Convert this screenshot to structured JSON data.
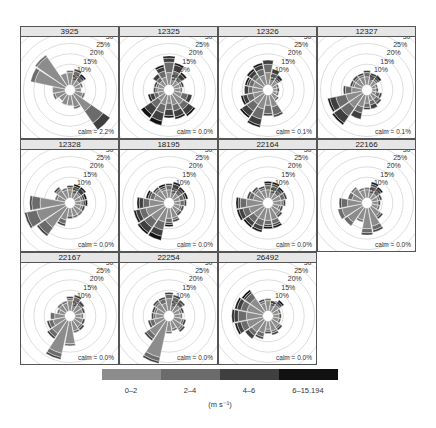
{
  "chart_data": {
    "type": "windrose",
    "title": "",
    "layout": {
      "rows": 3,
      "cols": 4
    },
    "axis": {
      "rings_percent": [
        5,
        10,
        15,
        20,
        25,
        30
      ],
      "ring_labels": [
        "5%",
        "10%",
        "15%",
        "20%",
        "25%",
        "30"
      ]
    },
    "directions": [
      "N",
      "NNE",
      "NE",
      "ENE",
      "E",
      "ESE",
      "SE",
      "SSE",
      "S",
      "SSW",
      "SW",
      "WSW",
      "W",
      "WNW",
      "NW",
      "NNW"
    ],
    "speed_bins": [
      "0-2",
      "2-4",
      "4-6",
      "6-15.194"
    ],
    "speed_colors": [
      "#8c8c8c",
      "#6b6b6b",
      "#3f3f3f",
      "#111111"
    ],
    "legend_units": "(m s⁻¹)",
    "panels": [
      {
        "name": "3925",
        "calm": "calm = 2.2%",
        "petals": [
          [
            6,
            7,
            7,
            7
          ],
          [
            5,
            7,
            8,
            8
          ],
          [
            3,
            5,
            6,
            7
          ],
          [
            3,
            4,
            4,
            4
          ],
          [
            3,
            3,
            3,
            3
          ],
          [
            4,
            5,
            5,
            5
          ],
          [
            10,
            17,
            21,
            21
          ],
          [
            6,
            7,
            7,
            7
          ],
          [
            5,
            5,
            5,
            5
          ],
          [
            5,
            5,
            5,
            5
          ],
          [
            4,
            4,
            4,
            4
          ],
          [
            5,
            6,
            6,
            6
          ],
          [
            6,
            6,
            6,
            6
          ],
          [
            15,
            17,
            17,
            17
          ],
          [
            17,
            18,
            18,
            18
          ],
          [
            6,
            6,
            6,
            6
          ]
        ]
      },
      {
        "name": "12325",
        "calm": "calm = 0.0%",
        "petals": [
          [
            6,
            11,
            13,
            14
          ],
          [
            4,
            7,
            10,
            11
          ],
          [
            3,
            5,
            7,
            8
          ],
          [
            3,
            4,
            5,
            5
          ],
          [
            3,
            4,
            4,
            4
          ],
          [
            4,
            7,
            9,
            9
          ],
          [
            6,
            9,
            12,
            13
          ],
          [
            5,
            8,
            11,
            12
          ],
          [
            4,
            7,
            10,
            11
          ],
          [
            5,
            9,
            13,
            15
          ],
          [
            4,
            8,
            12,
            14
          ],
          [
            3,
            5,
            7,
            8
          ],
          [
            3,
            4,
            5,
            5
          ],
          [
            3,
            4,
            5,
            5
          ],
          [
            3,
            5,
            7,
            7
          ],
          [
            4,
            7,
            9,
            10
          ]
        ]
      },
      {
        "name": "12326",
        "calm": "calm = 0.1%",
        "petals": [
          [
            6,
            10,
            12,
            12
          ],
          [
            4,
            6,
            8,
            8
          ],
          [
            3,
            4,
            5,
            6
          ],
          [
            2,
            3,
            3,
            3
          ],
          [
            2,
            2,
            3,
            3
          ],
          [
            2,
            3,
            3,
            3
          ],
          [
            3,
            4,
            4,
            4
          ],
          [
            6,
            10,
            11,
            11
          ],
          [
            5,
            9,
            10,
            10
          ],
          [
            7,
            12,
            15,
            16
          ],
          [
            6,
            10,
            13,
            14
          ],
          [
            5,
            8,
            10,
            11
          ],
          [
            5,
            7,
            9,
            9
          ],
          [
            5,
            7,
            8,
            9
          ],
          [
            5,
            7,
            9,
            10
          ],
          [
            5,
            8,
            10,
            11
          ]
        ]
      },
      {
        "name": "12327",
        "calm": "calm = 0.1%",
        "petals": [
          [
            4,
            6,
            7,
            7
          ],
          [
            3,
            5,
            6,
            6
          ],
          [
            3,
            4,
            5,
            6
          ],
          [
            2,
            3,
            3,
            3
          ],
          [
            2,
            2,
            3,
            3
          ],
          [
            2,
            4,
            5,
            5
          ],
          [
            3,
            5,
            6,
            6
          ],
          [
            3,
            5,
            7,
            7
          ],
          [
            4,
            6,
            7,
            7
          ],
          [
            6,
            9,
            12,
            12
          ],
          [
            8,
            13,
            17,
            18
          ],
          [
            8,
            13,
            16,
            17
          ],
          [
            5,
            8,
            9,
            9
          ],
          [
            4,
            5,
            6,
            6
          ],
          [
            4,
            5,
            6,
            6
          ],
          [
            4,
            5,
            6,
            6
          ]
        ]
      },
      {
        "name": "12328",
        "calm": "calm = 0.0%",
        "petals": [
          [
            4,
            5,
            6,
            6
          ],
          [
            4,
            5,
            6,
            7
          ],
          [
            3,
            4,
            6,
            7
          ],
          [
            3,
            4,
            5,
            6
          ],
          [
            3,
            4,
            5,
            6
          ],
          [
            3,
            4,
            5,
            5
          ],
          [
            4,
            5,
            5,
            5
          ],
          [
            4,
            5,
            5,
            5
          ],
          [
            4,
            4,
            5,
            5
          ],
          [
            6,
            8,
            9,
            9
          ],
          [
            12,
            16,
            17,
            17
          ],
          [
            14,
            19,
            20,
            20
          ],
          [
            12,
            16,
            17,
            17
          ],
          [
            4,
            5,
            5,
            5
          ],
          [
            5,
            6,
            7,
            7
          ],
          [
            4,
            5,
            5,
            5
          ]
        ]
      },
      {
        "name": "18195",
        "calm": "calm = 0.0%",
        "petals": [
          [
            4,
            6,
            7,
            7
          ],
          [
            4,
            5,
            7,
            8
          ],
          [
            3,
            5,
            6,
            7
          ],
          [
            3,
            5,
            6,
            7
          ],
          [
            3,
            5,
            6,
            6
          ],
          [
            3,
            4,
            5,
            5
          ],
          [
            3,
            4,
            5,
            5
          ],
          [
            5,
            6,
            7,
            7
          ],
          [
            5,
            7,
            8,
            9
          ],
          [
            7,
            11,
            14,
            16
          ],
          [
            8,
            12,
            15,
            16
          ],
          [
            9,
            12,
            14,
            15
          ],
          [
            7,
            10,
            12,
            13
          ],
          [
            5,
            7,
            8,
            9
          ],
          [
            5,
            6,
            7,
            7
          ],
          [
            4,
            5,
            6,
            7
          ]
        ]
      },
      {
        "name": "22164",
        "calm": "calm = 0.0%",
        "petals": [
          [
            4,
            6,
            7,
            8
          ],
          [
            4,
            6,
            7,
            8
          ],
          [
            3,
            5,
            6,
            7
          ],
          [
            4,
            6,
            7,
            7
          ],
          [
            4,
            5,
            6,
            6
          ],
          [
            3,
            4,
            5,
            5
          ],
          [
            4,
            5,
            6,
            6
          ],
          [
            6,
            8,
            9,
            10
          ],
          [
            6,
            8,
            9,
            10
          ],
          [
            6,
            9,
            11,
            12
          ],
          [
            6,
            9,
            11,
            12
          ],
          [
            7,
            10,
            12,
            13
          ],
          [
            8,
            11,
            12,
            13
          ],
          [
            5,
            7,
            8,
            8
          ],
          [
            5,
            6,
            7,
            7
          ],
          [
            4,
            5,
            6,
            6
          ]
        ]
      },
      {
        "name": "22166",
        "calm": "calm = 0.0%",
        "petals": [
          [
            4,
            5,
            5,
            5
          ],
          [
            4,
            6,
            7,
            8
          ],
          [
            3,
            5,
            6,
            7
          ],
          [
            3,
            4,
            5,
            5
          ],
          [
            3,
            3,
            4,
            4
          ],
          [
            3,
            4,
            4,
            4
          ],
          [
            5,
            6,
            7,
            7
          ],
          [
            9,
            11,
            12,
            12
          ],
          [
            10,
            12,
            13,
            13
          ],
          [
            6,
            7,
            7,
            7
          ],
          [
            9,
            11,
            11,
            11
          ],
          [
            10,
            12,
            12,
            12
          ],
          [
            7,
            10,
            11,
            11
          ],
          [
            5,
            7,
            7,
            7
          ],
          [
            6,
            7,
            7,
            7
          ],
          [
            4,
            5,
            5,
            5
          ]
        ]
      },
      {
        "name": "22167",
        "calm": "calm = 0.0%",
        "petals": [
          [
            5,
            6,
            7,
            7
          ],
          [
            5,
            7,
            8,
            8
          ],
          [
            4,
            5,
            6,
            6
          ],
          [
            4,
            4,
            5,
            5
          ],
          [
            3,
            4,
            4,
            4
          ],
          [
            4,
            4,
            5,
            5
          ],
          [
            4,
            5,
            6,
            6
          ],
          [
            5,
            6,
            6,
            6
          ],
          [
            11,
            12,
            12,
            12
          ],
          [
            16,
            18,
            19,
            19
          ],
          [
            8,
            10,
            11,
            11
          ],
          [
            6,
            8,
            9,
            9
          ],
          [
            5,
            7,
            7,
            7
          ],
          [
            3,
            4,
            4,
            4
          ],
          [
            4,
            5,
            5,
            5
          ],
          [
            4,
            5,
            5,
            5
          ]
        ]
      },
      {
        "name": "22254",
        "calm": "calm = 0.0%",
        "petals": [
          [
            6,
            8,
            9,
            9
          ],
          [
            5,
            7,
            8,
            8
          ],
          [
            4,
            6,
            7,
            7
          ],
          [
            3,
            4,
            5,
            5
          ],
          [
            3,
            4,
            4,
            4
          ],
          [
            4,
            5,
            6,
            6
          ],
          [
            5,
            6,
            7,
            7
          ],
          [
            4,
            5,
            5,
            5
          ],
          [
            5,
            6,
            6,
            6
          ],
          [
            18,
            20,
            21,
            21
          ],
          [
            9,
            11,
            12,
            12
          ],
          [
            5,
            7,
            8,
            8
          ],
          [
            4,
            5,
            6,
            6
          ],
          [
            4,
            5,
            6,
            6
          ],
          [
            5,
            6,
            7,
            7
          ],
          [
            4,
            6,
            7,
            7
          ]
        ]
      },
      {
        "name": "26492",
        "calm": "calm = 0.0%",
        "petals": [
          [
            5,
            6,
            6,
            6
          ],
          [
            3,
            4,
            5,
            5
          ],
          [
            4,
            5,
            6,
            7
          ],
          [
            3,
            4,
            4,
            4
          ],
          [
            3,
            3,
            4,
            4
          ],
          [
            3,
            4,
            4,
            4
          ],
          [
            4,
            5,
            6,
            6
          ],
          [
            5,
            6,
            7,
            7
          ],
          [
            4,
            5,
            6,
            6
          ],
          [
            6,
            8,
            9,
            9
          ],
          [
            7,
            9,
            11,
            11
          ],
          [
            8,
            11,
            13,
            14
          ],
          [
            8,
            12,
            14,
            15
          ],
          [
            8,
            11,
            13,
            14
          ],
          [
            8,
            11,
            12,
            13
          ],
          [
            4,
            5,
            6,
            6
          ]
        ]
      }
    ]
  },
  "legend": {
    "labels": [
      "0–2",
      "2–4",
      "4–6",
      "6–15.194"
    ],
    "units": "(m s⁻¹)"
  }
}
